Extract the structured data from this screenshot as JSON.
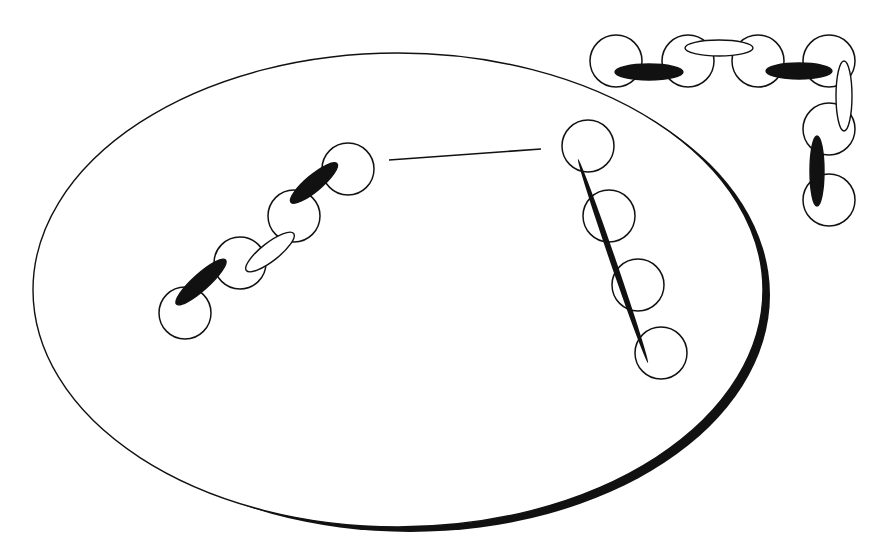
{
  "diagram": {
    "width": 888,
    "height": 558,
    "background": "#ffffff",
    "stroke": "#111111",
    "main_ellipse": {
      "cx": 398,
      "cy": 290,
      "rx": 365,
      "ry": 237,
      "stroke_width": 1.4
    },
    "shadow_ellipse": {
      "cx": 410,
      "cy": 295,
      "rx": 360,
      "ry": 237,
      "fill": "#111111"
    },
    "connector_line": {
      "x1": 389,
      "y1": 160,
      "x2": 541,
      "y2": 149,
      "stroke_width": 1.6
    },
    "chain_diagonal": {
      "circles": [
        {
          "cx": 185,
          "cy": 313,
          "r": 26
        },
        {
          "cx": 240,
          "cy": 263,
          "r": 26
        },
        {
          "cx": 294,
          "cy": 216,
          "r": 26
        },
        {
          "cx": 348,
          "cy": 169,
          "r": 26
        }
      ],
      "links": [
        {
          "cx": 201,
          "cy": 282,
          "rx": 33,
          "ry": 8,
          "angle": -42,
          "fill": "black"
        },
        {
          "cx": 270,
          "cy": 252,
          "rx": 30,
          "ry": 9,
          "angle": -38,
          "fill": "white"
        },
        {
          "cx": 314,
          "cy": 183,
          "rx": 30,
          "ry": 8,
          "angle": -40,
          "fill": "black"
        }
      ]
    },
    "chain_inside_right": {
      "circles": [
        {
          "cx": 588,
          "cy": 146,
          "r": 26
        },
        {
          "cx": 609,
          "cy": 216,
          "r": 26
        },
        {
          "cx": 638,
          "cy": 285,
          "r": 26
        },
        {
          "cx": 661,
          "cy": 353,
          "r": 26
        }
      ],
      "rod": {
        "x1": 578,
        "y1": 159,
        "x2": 648,
        "y2": 363,
        "width": 6
      }
    },
    "chain_corner": {
      "circles": [
        {
          "cx": 616,
          "cy": 61,
          "r": 26
        },
        {
          "cx": 688,
          "cy": 61,
          "r": 26
        },
        {
          "cx": 758,
          "cy": 61,
          "r": 26
        },
        {
          "cx": 829,
          "cy": 61,
          "r": 26
        },
        {
          "cx": 829,
          "cy": 129,
          "r": 26
        },
        {
          "cx": 829,
          "cy": 200,
          "r": 26
        }
      ],
      "links": [
        {
          "cx": 649,
          "cy": 72,
          "rx": 34,
          "ry": 8,
          "angle": 0,
          "fill": "black"
        },
        {
          "cx": 719,
          "cy": 48,
          "rx": 34,
          "ry": 8,
          "angle": 0,
          "fill": "white"
        },
        {
          "cx": 799,
          "cy": 71,
          "rx": 33,
          "ry": 8,
          "angle": 0,
          "fill": "black"
        },
        {
          "cx": 844,
          "cy": 96,
          "rx": 35,
          "ry": 8,
          "angle": 90,
          "fill": "white"
        },
        {
          "cx": 817,
          "cy": 171,
          "rx": 35,
          "ry": 7,
          "angle": 90,
          "fill": "black"
        }
      ]
    }
  }
}
